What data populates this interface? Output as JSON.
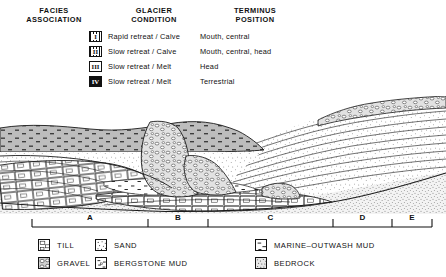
{
  "facies_table": {
    "headers": [
      {
        "line1": "FACIES",
        "line2": "ASSOCIATION"
      },
      {
        "line1": "GLACIER",
        "line2": "CONDITION"
      },
      {
        "line1": "TERMINUS",
        "line2": "POSITION"
      }
    ],
    "rows": [
      {
        "symbol": "I",
        "style": "hatch",
        "condition": "Rapid retreat / Calve",
        "terminus": "Mouth, central"
      },
      {
        "symbol": "II",
        "style": "hatch",
        "condition": "Slow retreat / Calve",
        "terminus": "Mouth, central, head"
      },
      {
        "symbol": "III",
        "style": "open",
        "condition": "Slow retreat / Melt",
        "terminus": "Head"
      },
      {
        "symbol": "IV",
        "style": "solid",
        "condition": "Slow retreat / Melt",
        "terminus": "Terrestrial"
      }
    ]
  },
  "scale_bar": {
    "segments": [
      {
        "label": "A",
        "x_start": 32,
        "x_end": 148
      },
      {
        "label": "B",
        "x_start": 148,
        "x_end": 208
      },
      {
        "label": "C",
        "x_start": 208,
        "x_end": 333
      },
      {
        "label": "D",
        "x_start": 333,
        "x_end": 392
      },
      {
        "label": "E",
        "x_start": 392,
        "x_end": 432
      }
    ]
  },
  "legend": {
    "rows": [
      [
        {
          "pattern": "till",
          "label": "TILL"
        },
        {
          "pattern": "sand",
          "label": "SAND"
        },
        {
          "pattern": "marine_mud",
          "label": "MARINE–OUTWASH MUD"
        }
      ],
      [
        {
          "pattern": "gravel",
          "label": "GRAVEL"
        },
        {
          "pattern": "bergstone_mud",
          "label": "BERGSTONE MUD"
        },
        {
          "pattern": "bedrock",
          "label": "BEDROCK"
        }
      ]
    ]
  },
  "colors": {
    "ink": "#111111",
    "marine_mud_fill": "#b9b9b9",
    "sand_fill": "#fdfdfd",
    "bedrock_fill": "#efefef",
    "paper": "#ffffff"
  }
}
